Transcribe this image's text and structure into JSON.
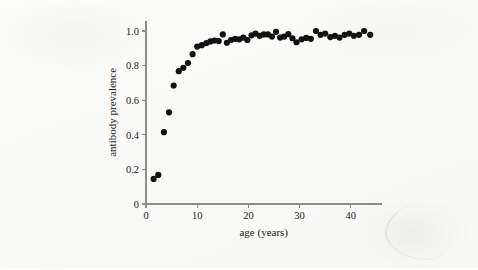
{
  "figure": {
    "background_color": "#fdfdfb",
    "ink_color": "#111111",
    "axis_color": "#8d8d8a"
  },
  "chart_data": {
    "type": "scatter",
    "title": "",
    "xlabel": "age (years)",
    "ylabel": "antibody prevalence",
    "xlim": [
      0,
      46
    ],
    "ylim": [
      0,
      1.06
    ],
    "xticks": [
      0,
      10,
      20,
      30,
      40
    ],
    "xtick_labels": [
      "0",
      "10",
      "20",
      "30",
      "40"
    ],
    "yticks": [
      0,
      0.2,
      0.4,
      0.6,
      0.8,
      1.0
    ],
    "ytick_labels": [
      "0",
      "0.2",
      "0.4",
      "0.6",
      "0.8",
      "1.0"
    ],
    "grid": false,
    "legend": false,
    "marker": "filled-circle",
    "marker_color": "#111111",
    "marker_size": 3.1,
    "series": [
      {
        "name": "antibody prevalence by age",
        "points": [
          [
            1.5,
            0.145
          ],
          [
            2.4,
            0.168
          ],
          [
            3.5,
            0.415
          ],
          [
            4.5,
            0.53
          ],
          [
            5.4,
            0.685
          ],
          [
            6.4,
            0.768
          ],
          [
            7.3,
            0.787
          ],
          [
            8.2,
            0.815
          ],
          [
            9.1,
            0.866
          ],
          [
            10.0,
            0.91
          ],
          [
            10.9,
            0.918
          ],
          [
            11.8,
            0.93
          ],
          [
            12.6,
            0.94
          ],
          [
            13.4,
            0.945
          ],
          [
            14.2,
            0.942
          ],
          [
            15.0,
            0.98
          ],
          [
            15.8,
            0.932
          ],
          [
            16.6,
            0.948
          ],
          [
            17.4,
            0.955
          ],
          [
            18.2,
            0.952
          ],
          [
            19.0,
            0.962
          ],
          [
            19.8,
            0.948
          ],
          [
            20.6,
            0.975
          ],
          [
            21.4,
            0.985
          ],
          [
            22.2,
            0.972
          ],
          [
            23.0,
            0.98
          ],
          [
            23.8,
            0.98
          ],
          [
            24.6,
            0.968
          ],
          [
            25.4,
            0.995
          ],
          [
            26.2,
            0.962
          ],
          [
            27.0,
            0.968
          ],
          [
            27.8,
            0.982
          ],
          [
            28.6,
            0.958
          ],
          [
            29.4,
            0.935
          ],
          [
            30.4,
            0.952
          ],
          [
            31.3,
            0.96
          ],
          [
            32.2,
            0.955
          ],
          [
            33.2,
            1.0
          ],
          [
            34.1,
            0.978
          ],
          [
            35.0,
            0.985
          ],
          [
            36.0,
            0.965
          ],
          [
            36.9,
            0.972
          ],
          [
            37.8,
            0.962
          ],
          [
            38.8,
            0.978
          ],
          [
            39.7,
            0.985
          ],
          [
            40.6,
            0.972
          ],
          [
            41.6,
            0.978
          ],
          [
            42.6,
            1.0
          ],
          [
            43.8,
            0.978
          ]
        ]
      }
    ]
  }
}
